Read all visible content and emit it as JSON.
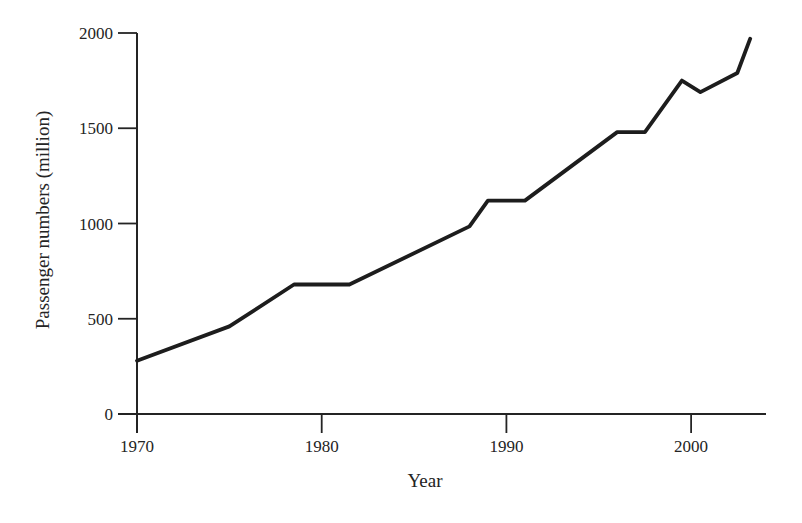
{
  "figure": {
    "background": "#ffffff",
    "ink_color": "#242424"
  },
  "chart_data": {
    "type": "line",
    "title": "",
    "xlabel": "Year",
    "ylabel": "Passenger numbers (million)",
    "xlim": [
      1970,
      2004
    ],
    "ylim": [
      0,
      2000
    ],
    "x_ticks": [
      "1970",
      "1980",
      "1990",
      "2000"
    ],
    "x_tick_values": [
      1970,
      1980,
      1990,
      2000
    ],
    "y_ticks": [
      "0",
      "500",
      "1000",
      "1500",
      "2000"
    ],
    "y_tick_values": [
      0,
      500,
      1000,
      1500,
      2000
    ],
    "grid": false,
    "legend_position": "none",
    "series": [
      {
        "name": "Passenger numbers",
        "color": "#1d1d1d",
        "line_width": 3.8,
        "points": [
          {
            "x": 1970,
            "y": 280
          },
          {
            "x": 1975,
            "y": 460
          },
          {
            "x": 1978.5,
            "y": 680
          },
          {
            "x": 1981.5,
            "y": 680
          },
          {
            "x": 1988,
            "y": 985
          },
          {
            "x": 1989,
            "y": 1120
          },
          {
            "x": 1991,
            "y": 1120
          },
          {
            "x": 1996,
            "y": 1480
          },
          {
            "x": 1997.5,
            "y": 1480
          },
          {
            "x": 1999.5,
            "y": 1750
          },
          {
            "x": 2000.5,
            "y": 1690
          },
          {
            "x": 2002.5,
            "y": 1790
          },
          {
            "x": 2003.2,
            "y": 1970
          }
        ]
      }
    ]
  }
}
